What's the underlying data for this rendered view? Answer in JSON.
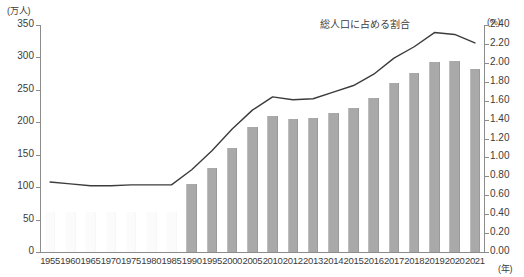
{
  "chart_data": {
    "type": "bar",
    "title": "",
    "subtitle": "",
    "xlabel": "(年)",
    "ylabel": "(万人)",
    "y2label": "(%)",
    "grid": false,
    "legend_position": "inline-annotation",
    "categories": [
      "1955",
      "1960",
      "1965",
      "1970",
      "1975",
      "1980",
      "1985",
      "1990",
      "1995",
      "2000",
      "2005",
      "2010",
      "2012",
      "2013",
      "2014",
      "2015",
      "2016",
      "2017",
      "2018",
      "2019",
      "2020",
      "2021"
    ],
    "ylim": [
      0,
      350
    ],
    "yticks": [
      0,
      50,
      100,
      150,
      200,
      250,
      300,
      350
    ],
    "ytick_labels": [
      "0",
      "50",
      "100",
      "150",
      "200",
      "250",
      "300",
      "350"
    ],
    "y2lim": [
      0,
      2.4
    ],
    "y2ticks": [
      0.0,
      0.2,
      0.4,
      0.6,
      0.8,
      1.0,
      1.2,
      1.4,
      1.6,
      1.8,
      2.0,
      2.2,
      2.4
    ],
    "y2tick_labels": [
      "0.00",
      "0.20",
      "0.40",
      "0.60",
      "0.80",
      "1.00",
      "1.20",
      "1.40",
      "1.60",
      "1.80",
      "2.00",
      "2.20",
      "2.40"
    ],
    "series": [
      {
        "name": "bars",
        "type": "bar",
        "axis": "left",
        "unit": "万人",
        "color": "#a9a9a9",
        "values": [
          null,
          null,
          null,
          null,
          null,
          null,
          null,
          105,
          130,
          160,
          192,
          210,
          205,
          206,
          215,
          222,
          238,
          260,
          276,
          293,
          295,
          282
        ]
      },
      {
        "name": "総人口に占める割合",
        "type": "line",
        "axis": "right",
        "unit": "%",
        "color": "#3c3c3c",
        "values": [
          0.74,
          0.72,
          0.7,
          0.7,
          0.71,
          0.71,
          0.71,
          0.87,
          1.07,
          1.3,
          1.5,
          1.64,
          1.61,
          1.62,
          1.69,
          1.76,
          1.88,
          2.05,
          2.17,
          2.32,
          2.3,
          2.21
        ]
      }
    ],
    "annotation": {
      "text": "総人口に占める割合",
      "target_series": "総人口に占める割合"
    }
  },
  "axes": {
    "left_unit": "(万人)",
    "right_unit": "(%)",
    "x_unit": "(年)"
  },
  "colors": {
    "bar": "#a9a9a9",
    "line": "#3c3c3c",
    "axis": "#8c8c8c",
    "text": "#3c3c3c",
    "background": "#ffffff"
  }
}
